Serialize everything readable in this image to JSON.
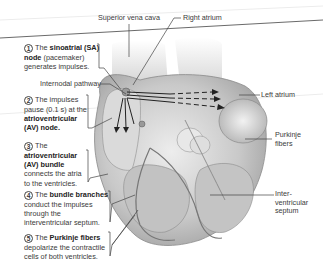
{
  "figure": {
    "labels": {
      "superior_vena_cava": "Superior vena cava",
      "right_atrium": "Right atrium",
      "internodal_pathway": "Internodal pathway",
      "left_atrium": "Left atrium",
      "purkinje_fibers_line1": "Purkinje",
      "purkinje_fibers_line2": "fibers",
      "septum_line1": "Inter-",
      "septum_line2": "ventricular",
      "septum_line3": "septum"
    },
    "steps": [
      {
        "number": "1",
        "line1_pre": "The ",
        "line1_bold": "sinoatrial (SA)",
        "line2_bold": "node",
        "line2_post": " (pacemaker)",
        "line3": "generates impulses."
      },
      {
        "number": "2",
        "line1": "The impulses",
        "line2": "pause (0.1 s) at the",
        "line3_bold": "atrioventricular",
        "line4_bold": "(AV) node."
      },
      {
        "number": "3",
        "line1": "The",
        "line2_bold": "atrioventricular",
        "line3_bold": "(AV) bundle",
        "line4": "connects the atria",
        "line5": "to the ventricles."
      },
      {
        "number": "4",
        "line1_pre": "The ",
        "line1_bold": "bundle branches",
        "line2": "conduct the impulses",
        "line3": "through the",
        "line4": "interventricular septum."
      },
      {
        "number": "5",
        "line1_pre": "The ",
        "line1_bold": "Purkinje fibers",
        "line2": "depolarize the contractile",
        "line3": "cells of both ventricles."
      }
    ],
    "colors": {
      "line": "#444444",
      "heart_light": "#e6e6e6",
      "heart_mid": "#bdbdbd",
      "heart_dark": "#8a8a8a",
      "arrow": "#222222"
    }
  }
}
